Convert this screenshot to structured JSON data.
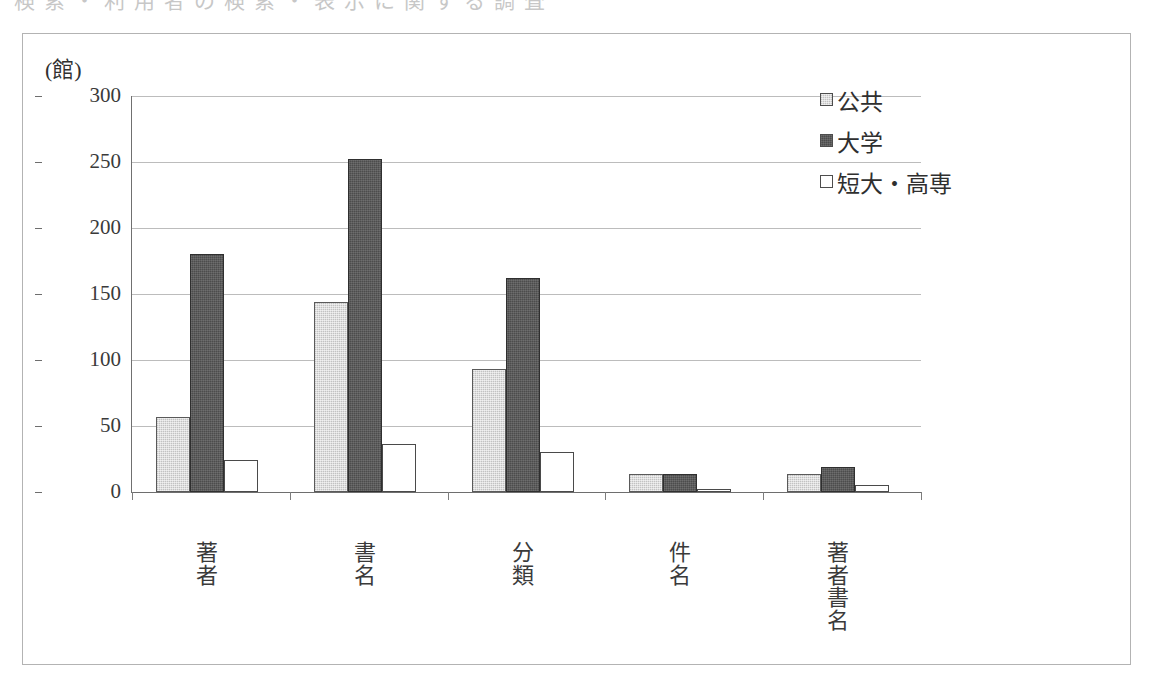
{
  "scan_artifact_text": "検索・利用者の検索・表示に関する調査",
  "figure": {
    "unit_label": "(館)"
  },
  "legend": {
    "position": "right",
    "items": [
      {
        "label": "公共",
        "swatch": "light-gray-square-icon",
        "color": "#dedede"
      },
      {
        "label": "大学",
        "swatch": "dark-gray-square-icon",
        "color": "#4c4c4c"
      },
      {
        "label": "短大・高専",
        "swatch": "white-square-icon",
        "color": "#ffffff"
      }
    ]
  },
  "chart_data": {
    "type": "bar",
    "title": "",
    "subtitle": "",
    "xlabel": "",
    "ylabel": "(館)",
    "ylim": [
      0,
      300
    ],
    "yticks": [
      0,
      50,
      100,
      150,
      200,
      250,
      300
    ],
    "ytick_labels": [
      "0",
      "50",
      "100",
      "150",
      "200",
      "250",
      "300"
    ],
    "grid": true,
    "legend_position": "right",
    "categories": [
      "著者",
      "書名",
      "分類",
      "件名",
      "著者書名"
    ],
    "series": [
      {
        "name": "公共",
        "color": "#dedede",
        "values": [
          57,
          144,
          93,
          14,
          14
        ]
      },
      {
        "name": "大学",
        "color": "#4c4c4c",
        "values": [
          180,
          252,
          162,
          14,
          19
        ]
      },
      {
        "name": "短大・高専",
        "color": "#ffffff",
        "values": [
          24,
          36,
          30,
          2,
          5
        ]
      }
    ]
  }
}
